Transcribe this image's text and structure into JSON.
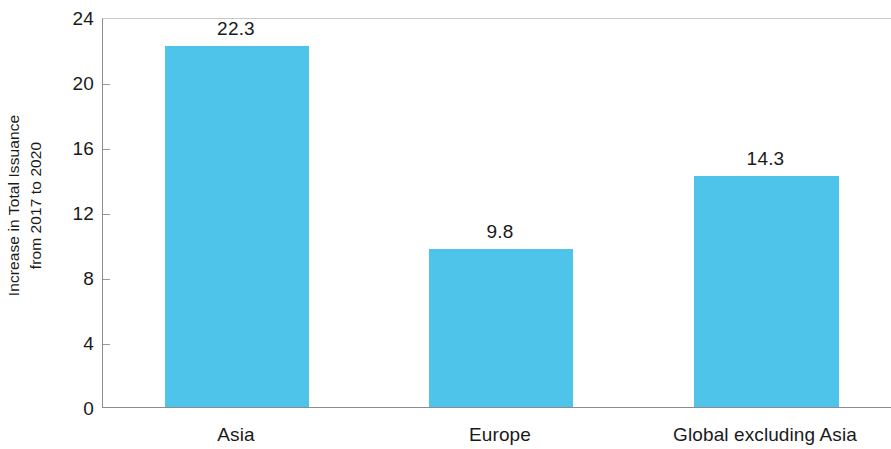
{
  "chart_data": {
    "type": "bar",
    "title": "",
    "subtitle": "",
    "xlabel": "",
    "ylabel_line1": "Increase in Total Issuance",
    "ylabel_line2": "from 2017 to 2020",
    "categories": [
      "Asia",
      "Europe",
      "Global excluding Asia"
    ],
    "values": [
      22.3,
      9.8,
      14.3
    ],
    "value_labels": [
      "22.3",
      "9.8",
      "14.3"
    ],
    "ylim": [
      0,
      24
    ],
    "ytick_labels": [
      "24",
      "20",
      "16",
      "12",
      "8",
      "4",
      "0"
    ],
    "ytick_values": [
      24,
      20,
      16,
      12,
      8,
      4,
      0
    ],
    "grid": false,
    "legend": "none",
    "bar_color": "#4fc4ea",
    "axis_color": "#8c8c8c",
    "text_color": "#1a1a1a",
    "background": "#ffffff"
  }
}
